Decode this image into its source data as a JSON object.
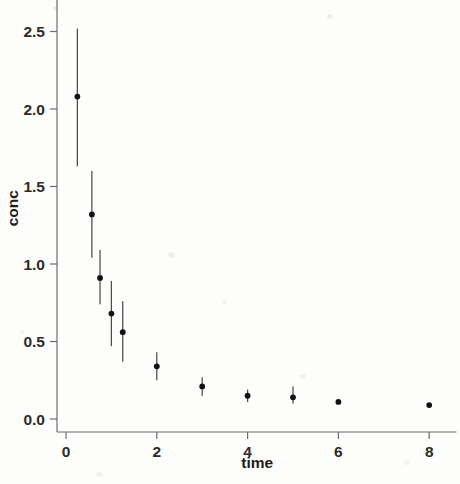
{
  "chart_data": {
    "type": "scatter",
    "title": "",
    "subtitle": "",
    "xlabel": "time",
    "ylabel": "conc",
    "xlim": [
      -0.35,
      8.6
    ],
    "ylim": [
      -0.12,
      2.72
    ],
    "grid": false,
    "legend": null,
    "error_bars": "vertical",
    "xticks": [
      0,
      2,
      4,
      6,
      8
    ],
    "xticklabels": [
      "0",
      "2",
      "4",
      "6",
      "8"
    ],
    "yticks": [
      0.0,
      0.5,
      1.0,
      1.5,
      2.0,
      2.5
    ],
    "yticklabels": [
      "0.0",
      "0.5",
      "1.0",
      "1.5",
      "2.0",
      "2.5"
    ],
    "marker": "filled-circle",
    "marker_color": "#121212",
    "errorbar_color": "#4b4b4b",
    "axis_color": "#6d6d6d",
    "background": "#fdfdfc",
    "x": [
      0.25,
      0.57,
      0.75,
      1.0,
      1.25,
      2.0,
      3.0,
      4.0,
      5.0,
      6.0,
      8.0
    ],
    "y": [
      2.08,
      1.32,
      0.91,
      0.68,
      0.56,
      0.34,
      0.21,
      0.15,
      0.14,
      0.11,
      0.09
    ],
    "yerr_low": [
      1.63,
      1.04,
      0.74,
      0.47,
      0.37,
      0.25,
      0.15,
      0.11,
      0.1,
      0.11,
      0.09
    ],
    "yerr_high": [
      2.52,
      1.6,
      1.09,
      0.89,
      0.76,
      0.43,
      0.27,
      0.19,
      0.21,
      0.12,
      0.09
    ]
  }
}
